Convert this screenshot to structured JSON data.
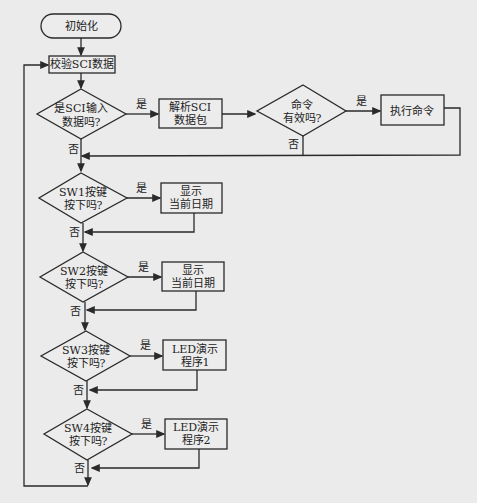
{
  "flowchart": {
    "nodes": {
      "start": "初始化",
      "check_sci": "校验SCI数据",
      "sci_q_1": "是SCI输入",
      "sci_q_2": "数据吗?",
      "parse_1": "解析SCI",
      "parse_2": "数据包",
      "cmd_q_1": "命令",
      "cmd_q_2": "有效吗?",
      "exec": "执行命令",
      "sw1_q_1": "SW1按键",
      "sw1_q_2": "按下吗?",
      "sw1_act_1": "显示",
      "sw1_act_2": "当前日期",
      "sw2_q_1": "SW2按键",
      "sw2_q_2": "按下吗?",
      "sw2_act_1": "显示",
      "sw2_act_2": "当前日期",
      "sw3_q_1": "SW3按键",
      "sw3_q_2": "按下吗?",
      "sw3_act_1": "LED演示",
      "sw3_act_2": "程序1",
      "sw4_q_1": "SW4按键",
      "sw4_q_2": "按下吗?",
      "sw4_act_1": "LED演示",
      "sw4_act_2": "程序2"
    },
    "edges": {
      "yes": "是",
      "no": "否"
    },
    "colors": {
      "line": "#2a2a2a",
      "background": "#ebebeb",
      "box_fill": "#ececec"
    }
  }
}
